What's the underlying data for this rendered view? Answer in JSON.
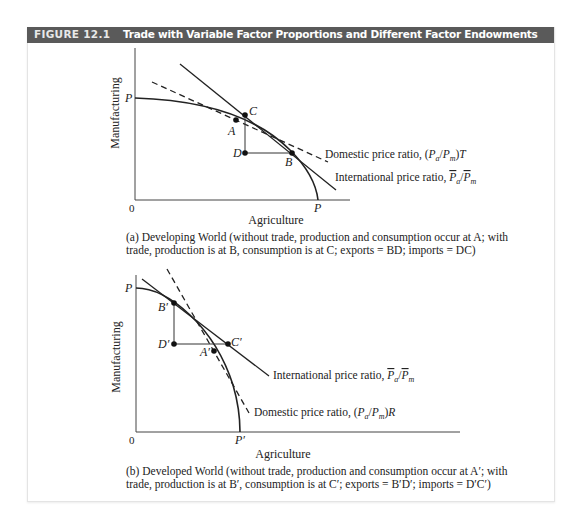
{
  "figure": {
    "number": "FIGURE 12.1",
    "title": "Trade with Variable Factor Proportions and Different Factor Endowments"
  },
  "panels": [
    {
      "id": "a",
      "y_label": "Manufacturing",
      "x_label": "Agriculture",
      "origin_label": "0",
      "y_intercept_label": "P",
      "x_intercept_label": "P",
      "points": {
        "A": "A",
        "B": "B",
        "C": "C",
        "D": "D"
      },
      "domestic_line_label": "Domestic price ratio, (P",
      "domestic_label_parts": [
        "Domestic price ratio, (",
        "P",
        "a",
        "/",
        "P",
        "m",
        ")",
        "T"
      ],
      "international_label_parts": [
        "International price ratio, ",
        "P",
        "a",
        "/",
        "P",
        "m"
      ],
      "caption_line1": "(a) Developing World (without trade, production and consumption occur at A; with",
      "caption_line2": "trade, production is at B, consumption is at C; exports = BD; imports = DC)"
    },
    {
      "id": "b",
      "y_label": "Manufacturing",
      "x_label": "Agriculture",
      "origin_label": "0",
      "y_intercept_label": "P",
      "x_intercept_label": "P′",
      "points": {
        "A": "A′",
        "B": "B′",
        "C": "C′",
        "D": "D′"
      },
      "domestic_label_parts": [
        "Domestic price ratio, (",
        "P",
        "a",
        "/",
        "P",
        "m",
        ")",
        "R"
      ],
      "international_label_parts": [
        "International price ratio, ",
        "P",
        "a",
        "/",
        "P",
        "m"
      ],
      "caption_line1": "(b) Developed World (without trade, production and consumption occur at A′; with",
      "caption_line2": "trade, production is at B′, consumption is at C′; exports = B′D′; imports = D′C′)"
    }
  ],
  "colors": {
    "header_bg": "#5a5a5a",
    "header_text": "#ffffff",
    "line": "#222222",
    "frame_border": "#e4e4e4"
  }
}
